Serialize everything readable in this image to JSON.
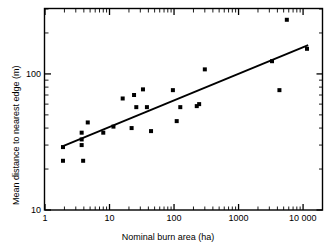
{
  "chart_data": {
    "type": "scatter",
    "title": "",
    "xlabel": "Nominal burn area (ha)",
    "ylabel": "Mean distance to nearest edge (m)",
    "xscale": "log",
    "yscale": "log",
    "xlim": [
      1,
      20000
    ],
    "ylim": [
      10,
      300
    ],
    "grid": false,
    "legend": null,
    "xticks": [
      {
        "value": 1,
        "label": "1"
      },
      {
        "value": 10,
        "label": "10"
      },
      {
        "value": 100,
        "label": "100"
      },
      {
        "value": 1000,
        "label": "1000"
      },
      {
        "value": 10000,
        "label": "10 000"
      }
    ],
    "yticks": [
      {
        "value": 10,
        "label": "10"
      },
      {
        "value": 100,
        "label": "100"
      }
    ],
    "marker": {
      "shape": "square",
      "color": "#000000",
      "size_px": 4
    },
    "points": [
      {
        "x": 1.9,
        "y": 29
      },
      {
        "x": 1.9,
        "y": 23
      },
      {
        "x": 3.7,
        "y": 37
      },
      {
        "x": 3.7,
        "y": 33
      },
      {
        "x": 3.7,
        "y": 30
      },
      {
        "x": 3.9,
        "y": 23
      },
      {
        "x": 4.6,
        "y": 44
      },
      {
        "x": 8.0,
        "y": 37
      },
      {
        "x": 11.5,
        "y": 41
      },
      {
        "x": 16.0,
        "y": 66
      },
      {
        "x": 22.0,
        "y": 40
      },
      {
        "x": 24.0,
        "y": 70
      },
      {
        "x": 26.0,
        "y": 57
      },
      {
        "x": 33.0,
        "y": 77
      },
      {
        "x": 38.0,
        "y": 57
      },
      {
        "x": 44.0,
        "y": 38
      },
      {
        "x": 96.0,
        "y": 76
      },
      {
        "x": 110.0,
        "y": 45
      },
      {
        "x": 125.0,
        "y": 57
      },
      {
        "x": 225.0,
        "y": 58
      },
      {
        "x": 245.0,
        "y": 60
      },
      {
        "x": 300.0,
        "y": 108
      },
      {
        "x": 3300.0,
        "y": 124
      },
      {
        "x": 4300.0,
        "y": 76
      },
      {
        "x": 5600.0,
        "y": 250
      },
      {
        "x": 11500.0,
        "y": 153
      }
    ],
    "trendline": {
      "type": "linear-on-log-log",
      "x_start": 1.9,
      "y_start": 29.5,
      "x_end": 12000,
      "y_end": 163,
      "color": "#000000",
      "width_px": 1.8
    },
    "annotations": []
  },
  "axes": {
    "frame_color": "#000000",
    "frame_width_px": 1.4,
    "tick_direction": "in"
  }
}
